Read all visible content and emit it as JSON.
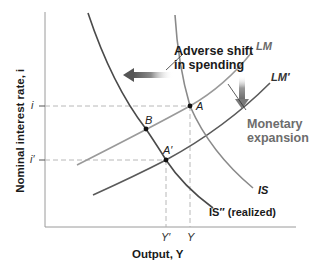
{
  "diagram": {
    "type": "IS-LM shift diagram",
    "axes": {
      "x_label": "Output, Y",
      "y_label": "Nominal interest rate, i",
      "x_ticks": [
        "Y′",
        "Y"
      ],
      "y_ticks": [
        "i",
        "i′"
      ]
    },
    "curves": [
      {
        "id": "IS",
        "label": "IS",
        "color": "#8a8a8a"
      },
      {
        "id": "IS_realized",
        "label": "IS″ (realized)",
        "color": "#4a4a4a"
      },
      {
        "id": "LM",
        "label": "LM",
        "color": "#9a9a9a"
      },
      {
        "id": "LM_prime",
        "label": "LM′",
        "color": "#5a5a5a"
      }
    ],
    "points": [
      {
        "label": "A",
        "curves": [
          "IS",
          "LM"
        ],
        "x_tick": "Y",
        "y_tick": "i"
      },
      {
        "label": "B",
        "curves": [
          "IS_realized",
          "LM"
        ]
      },
      {
        "label": "A′",
        "curves": [
          "IS_realized",
          "LM_prime"
        ],
        "x_tick": "Y′",
        "y_tick": "i′"
      }
    ],
    "annotations": [
      {
        "id": "adverse_shift",
        "lines": [
          "Adverse shift",
          "in spending"
        ],
        "arrow": "left",
        "color": "#1a1a1a"
      },
      {
        "id": "monetary_expansion",
        "lines": [
          "Monetary",
          "expansion"
        ],
        "arrow": "down",
        "color": "#6d6d6d"
      }
    ]
  }
}
